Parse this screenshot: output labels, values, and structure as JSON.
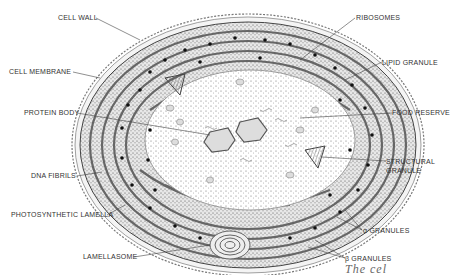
{
  "diagram": {
    "colors": {
      "ink": "#333333",
      "wall": "#8a8a8a",
      "background": "#ffffff",
      "stipple": "#555555"
    },
    "labels_left": [
      {
        "id": "cell-wall",
        "text": "CELL WALL"
      },
      {
        "id": "cell-membrane",
        "text": "CELL MEMBRANE"
      },
      {
        "id": "protein-body",
        "text": "PROTEIN BODY"
      },
      {
        "id": "dna-fibrils",
        "text": "DNA FIBRILS"
      },
      {
        "id": "photosynthetic-lamella",
        "text": "PHOTOSYNTHETIC LAMELLA"
      },
      {
        "id": "lamellasome",
        "text": "LAMELLASOME"
      }
    ],
    "labels_right": [
      {
        "id": "ribosomes",
        "text": "RIBOSOMES"
      },
      {
        "id": "lipid-granule",
        "text": "LIPID GRANULE"
      },
      {
        "id": "food-reserve",
        "text": "FOOD RESERVE"
      },
      {
        "id": "structural-granule-1",
        "text": "STRUCTURAL"
      },
      {
        "id": "structural-granule-2",
        "text": "GRANULE"
      },
      {
        "id": "alpha-granules",
        "text": "α GRANULES"
      },
      {
        "id": "beta-granules",
        "text": "β GRANULES"
      }
    ],
    "footer_fragment": "The cel"
  }
}
